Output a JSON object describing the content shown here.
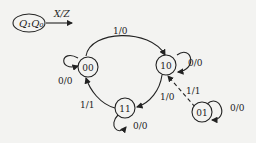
{
  "legend": {
    "state_label": "Q₁Q₀",
    "arrow_label": "X/Z"
  },
  "states": [
    {
      "id": "00",
      "label": "00"
    },
    {
      "id": "10",
      "label": "10"
    },
    {
      "id": "11",
      "label": "11"
    },
    {
      "id": "01",
      "label": "01"
    }
  ],
  "transitions": [
    {
      "from": "00",
      "to": "10",
      "label": "1/0"
    },
    {
      "from": "00",
      "to": "00",
      "label": "0/0"
    },
    {
      "from": "10",
      "to": "10",
      "label": "0/0"
    },
    {
      "from": "10",
      "to": "11",
      "label": "1/0"
    },
    {
      "from": "11",
      "to": "00",
      "label": "1/1"
    },
    {
      "from": "11",
      "to": "11",
      "label": "0/0"
    },
    {
      "from": "01",
      "to": "10",
      "label": "1/1",
      "style": "dashed"
    },
    {
      "from": "01",
      "to": "01",
      "label": "0/0"
    }
  ]
}
